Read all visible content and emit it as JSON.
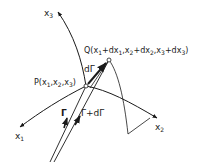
{
  "diagram": {
    "type": "curvilinear-coordinates-vector-diagram",
    "axes": [
      {
        "id": "x1",
        "label": "x",
        "sub": "1"
      },
      {
        "id": "x2",
        "label": "x",
        "sub": "2"
      },
      {
        "id": "x3",
        "label": "x",
        "sub": "3"
      }
    ],
    "points": {
      "P": {
        "name": "P",
        "coords": "(x1,x2,x3)"
      },
      "Q": {
        "name": "Q",
        "coords": "(x1+dx1,x2+dx2,x3+dx3)"
      }
    },
    "vectors": {
      "r": "Γ",
      "r_plus_dr": "Γ+dΓ",
      "dr": "dΓ"
    },
    "colors": {
      "ink": "#1a1a1a",
      "background": "#ffffff"
    }
  },
  "labels": {
    "x3_main": "x",
    "x3_sub": "3",
    "x1_main": "x",
    "x1_sub": "1",
    "x2_main": "x",
    "x2_sub": "2",
    "P_text": "P(x",
    "P_s1": "1",
    "P_c1": ",x",
    "P_s2": "2",
    "P_c2": ",x",
    "P_s3": "3",
    "P_end": ")",
    "Q_text": "Q(x",
    "Q_s1": "1",
    "Q_a1": "+dx",
    "Q_s1b": "1",
    "Q_c1": ",x",
    "Q_s2": "2",
    "Q_a2": "+dx",
    "Q_s2b": "2",
    "Q_c2": ",x",
    "Q_s3": "3",
    "Q_a3": "+dx",
    "Q_s3b": "3",
    "Q_end": ")",
    "gamma": "Γ",
    "gamma_plus": "Γ+dΓ",
    "d_gamma": "dΓ"
  }
}
